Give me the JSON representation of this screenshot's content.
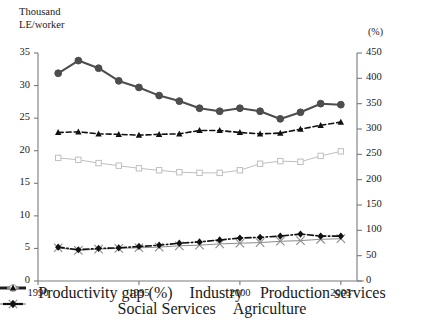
{
  "chart_data": {
    "type": "line",
    "title": "",
    "x": [
      1991,
      1992,
      1993,
      1994,
      1995,
      1996,
      1997,
      1998,
      1999,
      2000,
      2001,
      2002,
      2003,
      2004,
      2005
    ],
    "xlabel": "",
    "xtick_labels": [
      "1990",
      "1995",
      "2000",
      "2005"
    ],
    "xticks": [
      1990,
      1995,
      2000,
      2005
    ],
    "xlim": [
      1990,
      2005.8
    ],
    "left_axis": {
      "label": "Thousand\nLE/worker",
      "ylim": [
        0,
        35
      ],
      "ticks": [
        0,
        5,
        10,
        15,
        20,
        25,
        30,
        35
      ],
      "tick_labels": [
        "0",
        "5",
        "10",
        "15",
        "20",
        "25",
        "30",
        "35"
      ]
    },
    "right_axis": {
      "label": "(%)",
      "ylim": [
        0,
        450
      ],
      "ticks": [
        0,
        50,
        100,
        150,
        200,
        250,
        300,
        350,
        400,
        450
      ],
      "tick_labels": [
        "0",
        "50",
        "100",
        "150",
        "200",
        "250",
        "300",
        "350",
        "400",
        "450"
      ]
    },
    "grid": false,
    "legend_position": "bottom",
    "series": [
      {
        "name": "Productivity gap (%)",
        "axis": "right",
        "marker": "circle-filled",
        "color": "#4d4d4d",
        "linestyle": "solid",
        "values": [
          410,
          435,
          420,
          395,
          382,
          366,
          355,
          341,
          335,
          341,
          335,
          320,
          333,
          350,
          348
        ]
      },
      {
        "name": "Industry",
        "axis": "left",
        "marker": "square-open",
        "color": "#bfbfbf",
        "linestyle": "solid",
        "values": [
          18.9,
          18.6,
          18.1,
          17.7,
          17.3,
          17.0,
          16.7,
          16.6,
          16.6,
          17.0,
          18.0,
          18.4,
          18.3,
          19.2,
          19.9
        ]
      },
      {
        "name": "Production services",
        "axis": "left",
        "marker": "triangle-filled",
        "color": "#111111",
        "linestyle": "dashed",
        "values": [
          22.8,
          22.9,
          22.6,
          22.5,
          22.4,
          22.5,
          22.6,
          23.1,
          23.1,
          22.8,
          22.6,
          22.7,
          23.3,
          23.9,
          24.4
        ]
      },
      {
        "name": "Social Services",
        "axis": "left",
        "marker": "x-cross",
        "color": "#8c8c8c",
        "linestyle": "solid",
        "values": [
          5.1,
          4.7,
          4.9,
          5.0,
          5.1,
          5.2,
          5.4,
          5.5,
          5.7,
          5.8,
          5.9,
          6.1,
          6.2,
          6.4,
          6.5
        ]
      },
      {
        "name": "Agriculture",
        "axis": "left",
        "marker": "diamond-filled",
        "color": "#111111",
        "linestyle": "dashdot",
        "values": [
          5.2,
          4.8,
          5.0,
          5.1,
          5.3,
          5.5,
          5.8,
          6.0,
          6.3,
          6.6,
          6.7,
          6.9,
          7.2,
          6.9,
          6.9
        ]
      }
    ]
  },
  "legend": {
    "row1": [
      {
        "label": "Productivity gap (%)",
        "key": "line-circle-filled-gray"
      },
      {
        "label": "Industry",
        "key": "line-square-open-lightgray"
      },
      {
        "label": "Production services",
        "key": "dash-triangle-black"
      }
    ],
    "row2": [
      {
        "label": "Social Services",
        "key": "line-x-gray"
      },
      {
        "label": "Agriculture",
        "key": "diamond-black"
      }
    ]
  }
}
